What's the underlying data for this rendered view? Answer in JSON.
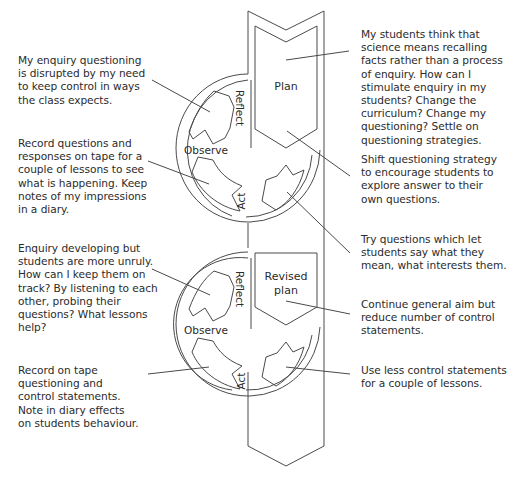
{
  "diagram": {
    "type": "action-research-spiral",
    "cycle1": {
      "plan_label": "Plan",
      "reflect_label": "Reflect",
      "observe_label": "Observe",
      "act_label": "Act"
    },
    "cycle2": {
      "plan_label": "Revised\nplan",
      "plan_label_line1": "Revised",
      "plan_label_line2": "plan",
      "reflect_label": "Reflect",
      "observe_label": "Observe",
      "act_label": "Act"
    },
    "notes_left": [
      {
        "id": "reflect1",
        "text": "My enquiry questioning\nis disrupted by my need\nto keep control in ways\nthe class expects."
      },
      {
        "id": "observe1",
        "text": "Record questions and\nresponses on tape for a\ncouple of lessons to see\nwhat is happening. Keep\nnotes of my impressions\nin a diary."
      },
      {
        "id": "reflect2",
        "text": "Enquiry developing but\nstudents are more unruly.\nHow can I keep them on\ntrack? By listening to each\nother, probing their\nquestions? What lessons\nhelp?"
      },
      {
        "id": "observe2",
        "text": "Record on tape\nquestioning and\ncontrol statements.\nNote in diary effects\non students behaviour."
      }
    ],
    "notes_right": [
      {
        "id": "plan1",
        "text": "My students think that\nscience means recalling\nfacts rather than a process\nof enquiry. How can I\nstimulate enquiry in my\nstudents? Change the\ncurriculum? Change my\nquestioning? Settle on\nquestioning strategies."
      },
      {
        "id": "plan1b",
        "text": "Shift questioning strategy\nto encourage students to\nexplore answer to their\nown questions."
      },
      {
        "id": "act1",
        "text": "Try questions which let\nstudents say what they\nmean, what interests them."
      },
      {
        "id": "plan2",
        "text": "Continue general aim but\nreduce number of control\nstatements."
      },
      {
        "id": "act2",
        "text": "Use less control statements\nfor a couple of lessons."
      }
    ],
    "colors": {
      "stroke": "#4a4a4a",
      "text": "#2b2b2b",
      "background": "#ffffff"
    }
  }
}
